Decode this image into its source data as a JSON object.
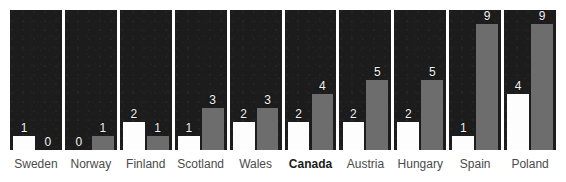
{
  "chart_data": {
    "type": "bar",
    "title": "",
    "subtitle": "",
    "xlabel": "",
    "ylabel": "",
    "ylim": [
      0,
      10
    ],
    "grid": false,
    "legend_position": "none",
    "categories": [
      "Sweden",
      "Norway",
      "Finland",
      "Scotland",
      "Wales",
      "Canada",
      "Austria",
      "Hungary",
      "Spain",
      "Poland"
    ],
    "highlight_category": "Canada",
    "series": [
      {
        "name": "white",
        "color": "#fdfdfd",
        "values": [
          1,
          0,
          2,
          1,
          2,
          2,
          2,
          2,
          1,
          4
        ]
      },
      {
        "name": "gray",
        "color": "#6d6d6d",
        "values": [
          0,
          1,
          1,
          3,
          3,
          4,
          5,
          5,
          9,
          9
        ]
      }
    ],
    "panel_background": "#1c1c1c",
    "value_label_color": "#f2f2f2"
  },
  "panels": [
    {
      "name": "Sweden",
      "bold": false,
      "left_value": "1",
      "right_value": "0"
    },
    {
      "name": "Norway",
      "bold": false,
      "left_value": "0",
      "right_value": "1"
    },
    {
      "name": "Finland",
      "bold": false,
      "left_value": "2",
      "right_value": "1"
    },
    {
      "name": "Scotland",
      "bold": false,
      "left_value": "1",
      "right_value": "3"
    },
    {
      "name": "Wales",
      "bold": false,
      "left_value": "2",
      "right_value": "3"
    },
    {
      "name": "Canada",
      "bold": true,
      "left_value": "2",
      "right_value": "4"
    },
    {
      "name": "Austria",
      "bold": false,
      "left_value": "2",
      "right_value": "5"
    },
    {
      "name": "Hungary",
      "bold": false,
      "left_value": "2",
      "right_value": "5"
    },
    {
      "name": "Spain",
      "bold": false,
      "left_value": "1",
      "right_value": "9"
    },
    {
      "name": "Poland",
      "bold": false,
      "left_value": "4",
      "right_value": "9"
    }
  ]
}
